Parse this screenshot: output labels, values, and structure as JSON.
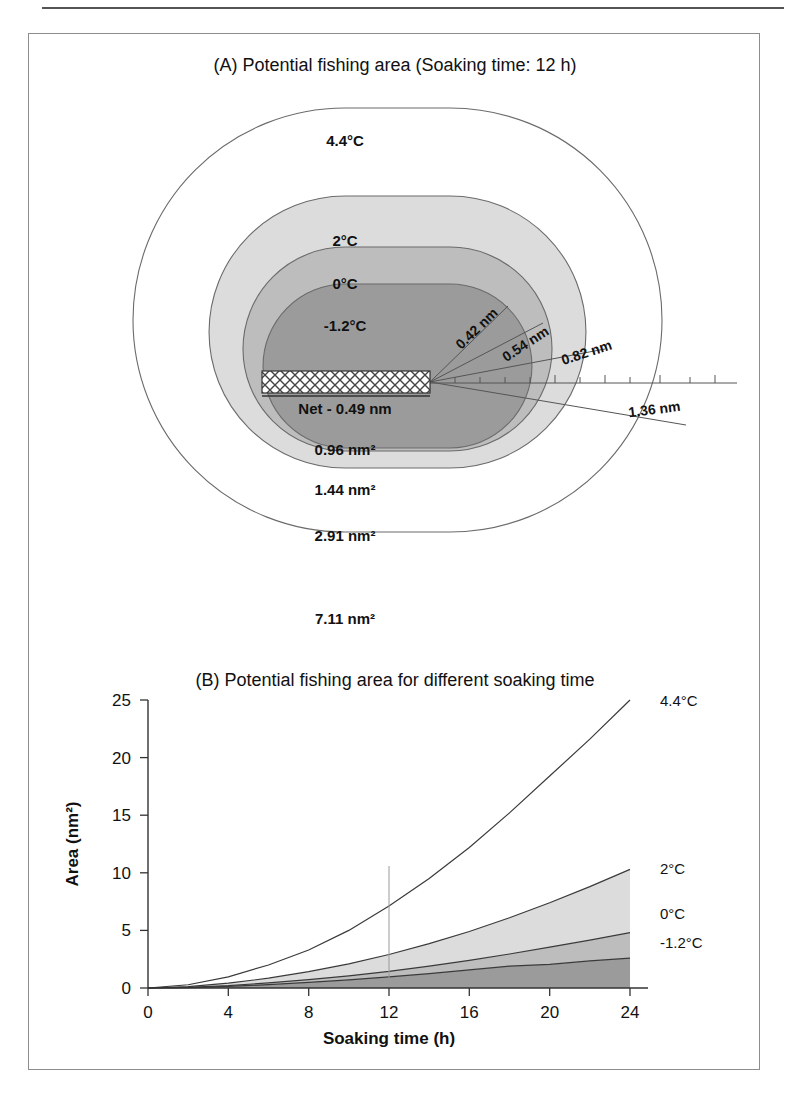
{
  "figure": {
    "panel_a": {
      "title": "(A) Potential fishing area (Soaking time: 12 h)",
      "net_label": "Net - 0.49 nm",
      "contour_temp_labels": [
        "4.4°C",
        "2°C",
        "0°C",
        "-1.2°C"
      ],
      "area_labels": [
        "0.96 nm²",
        "1.44 nm²",
        "2.91 nm²",
        "7.11 nm²"
      ],
      "radius_labels": [
        "0.42 nm",
        "0.54 nm",
        "0.82 nm",
        "1.36 nm"
      ],
      "colors": {
        "zone_minus12": "#9b9b9b",
        "zone_0": "#bdbdbd",
        "zone_2": "#dcdcdc",
        "zone_44": "#ffffff",
        "outline": "#6b6b6b"
      }
    },
    "panel_b": {
      "title": "(B) Potential fishing area for different soaking time",
      "reference_line_label": "12"
    }
  },
  "chart_data": {
    "type": "area",
    "title": "(B) Potential fishing area for different soaking time",
    "xlabel": "Soaking time (h)",
    "ylabel": "Area (nm²)",
    "xlim": [
      0,
      24
    ],
    "ylim": [
      0,
      25
    ],
    "xticks": [
      0,
      4,
      8,
      12,
      16,
      20,
      24
    ],
    "yticks": [
      0,
      5,
      10,
      15,
      20,
      25
    ],
    "grid": false,
    "legend_position": "right-of-curve-ends",
    "annotations": [
      {
        "text": "12",
        "type": "vertical-reference-line",
        "x": 12
      }
    ],
    "x": [
      0,
      2,
      4,
      6,
      8,
      10,
      12,
      14,
      16,
      18,
      20,
      22,
      24
    ],
    "series": [
      {
        "name": "4.4°C",
        "fill": "none",
        "values": [
          0.0,
          0.28,
          0.97,
          2.0,
          3.3,
          5.0,
          7.11,
          9.5,
          12.2,
          15.2,
          18.4,
          21.6,
          25.0
        ]
      },
      {
        "name": "2°C",
        "fill": "#dcdcdc",
        "values": [
          0.0,
          0.12,
          0.42,
          0.85,
          1.42,
          2.1,
          2.91,
          3.85,
          4.9,
          6.1,
          7.4,
          8.8,
          10.3
        ]
      },
      {
        "name": "0°C",
        "fill": "#bdbdbd",
        "values": [
          0.0,
          0.06,
          0.21,
          0.44,
          0.73,
          1.06,
          1.44,
          1.9,
          2.4,
          2.95,
          3.55,
          4.15,
          4.8
        ]
      },
      {
        "name": "-1.2°C",
        "fill": "#9b9b9b",
        "values": [
          0.0,
          0.04,
          0.14,
          0.29,
          0.48,
          0.7,
          0.96,
          1.25,
          1.57,
          1.9,
          2.05,
          2.35,
          2.6
        ]
      }
    ]
  }
}
